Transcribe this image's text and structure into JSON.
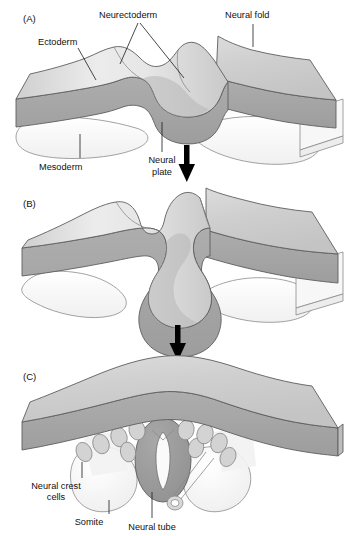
{
  "figure": {
    "panels": [
      {
        "id": "A",
        "label": "(A)",
        "labels": [
          {
            "name": "ectoderm",
            "text": "Ectoderm"
          },
          {
            "name": "neurectoderm",
            "text": "Neurectoderm"
          },
          {
            "name": "neural-fold",
            "text": "Neural fold"
          },
          {
            "name": "mesoderm",
            "text": "Mesoderm"
          },
          {
            "name": "neural-plate-line1",
            "text": "Neural"
          },
          {
            "name": "neural-plate-line2",
            "text": "plate"
          }
        ]
      },
      {
        "id": "B",
        "label": "(B)",
        "labels": []
      },
      {
        "id": "C",
        "label": "(C)",
        "labels": [
          {
            "name": "neural-crest-cells-line1",
            "text": "Neural crest"
          },
          {
            "name": "neural-crest-cells-line2",
            "text": "cells"
          },
          {
            "name": "somite",
            "text": "Somite"
          },
          {
            "name": "neural-tube",
            "text": "Neural tube"
          }
        ]
      }
    ],
    "arrows": [
      {
        "name": "arrow-a-to-b",
        "direction": "down"
      },
      {
        "name": "arrow-b-to-c",
        "direction": "down"
      }
    ],
    "colors": {
      "background": "#ffffff",
      "ectoderm_top": "#d2d2d2",
      "ectoderm_top_light": "#e2e2e2",
      "neurectoderm_band": "#a6a6a6",
      "neurectoderm_dark": "#949494",
      "mesoderm": "#fbfbfb",
      "somite": "#f4f4f4",
      "neural_tube": "#9a9a9a",
      "lumen": "#fafafa",
      "outline": "#5d5d5d",
      "text": "#111111",
      "arrow": "#000000"
    }
  }
}
